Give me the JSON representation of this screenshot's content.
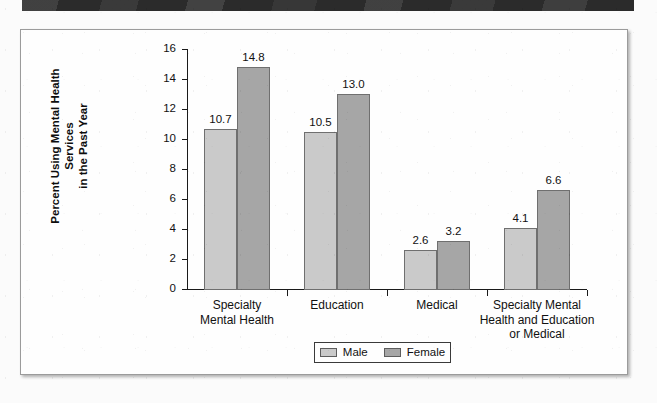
{
  "figure": {
    "frame_border_color": "#9b9b9b",
    "header_band_color": "#2b2b2b"
  },
  "legend": {
    "items": [
      {
        "label": "Male",
        "color": "#cacaca"
      },
      {
        "label": "Female",
        "color": "#a6a6a6"
      }
    ]
  },
  "chart_data": {
    "type": "bar",
    "title": "",
    "xlabel": "",
    "ylabel": "Percent Using Mental Health Services\nin the Past Year",
    "ylabel_line1": "Percent Using Mental Health Services",
    "ylabel_line2": "in the Past Year",
    "categories": [
      "Specialty\nMental Health",
      "Education",
      "Medical",
      "Specialty Mental\nHealth and Education\nor Medical"
    ],
    "series": [
      {
        "name": "Male",
        "color": "#cacaca",
        "values": [
          10.7,
          10.5,
          2.6,
          4.1
        ]
      },
      {
        "name": "Female",
        "color": "#a6a6a6",
        "values": [
          14.8,
          13.0,
          3.2,
          6.6
        ]
      }
    ],
    "value_labels": [
      "10.7",
      "14.8",
      "10.5",
      "13.0",
      "2.6",
      "3.2",
      "4.1",
      "6.6"
    ],
    "ylim": [
      0,
      16
    ],
    "yticks": [
      0,
      2,
      4,
      6,
      8,
      10,
      12,
      14,
      16
    ],
    "ytick_labels": [
      "0",
      "2",
      "4",
      "6",
      "8",
      "10",
      "12",
      "14",
      "16"
    ],
    "grid": false,
    "legend_position": "bottom-center"
  }
}
